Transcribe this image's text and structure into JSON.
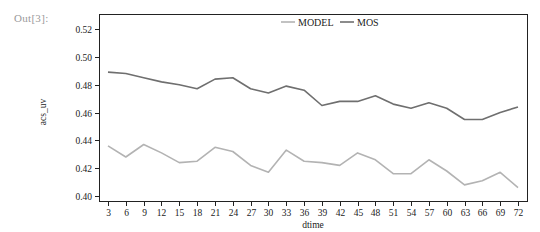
{
  "cell": {
    "prompt": "Out[3]:"
  },
  "chart_data": {
    "type": "line",
    "title": "",
    "xlabel": "dtime",
    "ylabel": "acs_uv",
    "x": [
      3,
      6,
      9,
      12,
      15,
      18,
      21,
      24,
      27,
      30,
      33,
      36,
      39,
      42,
      45,
      48,
      51,
      54,
      57,
      60,
      63,
      66,
      69,
      72
    ],
    "ylim": [
      0.398,
      0.532
    ],
    "yticks": [
      0.4,
      0.42,
      0.44,
      0.46,
      0.48,
      0.5,
      0.52
    ],
    "ytick_labels": [
      "0.40",
      "0.42",
      "0.44",
      "0.46",
      "0.48",
      "0.50",
      "0.52"
    ],
    "xtick_labels": [
      "3",
      "6",
      "9",
      "12",
      "15",
      "18",
      "21",
      "24",
      "27",
      "30",
      "33",
      "36",
      "39",
      "42",
      "45",
      "48",
      "51",
      "54",
      "57",
      "60",
      "63",
      "66",
      "69",
      "72"
    ],
    "grid": false,
    "legend_position": "top-center",
    "series": [
      {
        "name": "MODEL",
        "color": "#b3b3b3",
        "values": [
          0.436,
          0.428,
          0.437,
          0.431,
          0.424,
          0.425,
          0.435,
          0.432,
          0.422,
          0.417,
          0.433,
          0.425,
          0.424,
          0.422,
          0.431,
          0.426,
          0.416,
          0.416,
          0.426,
          0.418,
          0.408,
          0.411,
          0.417,
          0.406
        ]
      },
      {
        "name": "MOS",
        "color": "#6f6f6f",
        "values": [
          0.489,
          0.488,
          0.485,
          0.482,
          0.48,
          0.477,
          0.484,
          0.485,
          0.477,
          0.474,
          0.479,
          0.476,
          0.465,
          0.468,
          0.468,
          0.472,
          0.466,
          0.463,
          0.467,
          0.463,
          0.455,
          0.455,
          0.46,
          0.464
        ]
      }
    ]
  }
}
